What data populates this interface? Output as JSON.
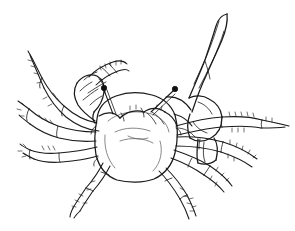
{
  "figure": {
    "view": "dorsal view",
    "medium": "black ink line drawing",
    "background_color": "#ffffff",
    "ink_color": "#1a1a1a",
    "width_px": 295,
    "height_px": 231,
    "caption": ""
  },
  "anatomy": {
    "carapace": {
      "label": "carapace",
      "outline_points": "96,118 99,104 110,96 128,92 150,93 166,99 174,112 176,134 172,156 160,172 140,180 118,180 101,170 94,150",
      "interior_contours": [
        "M108,120 C116,112 132,110 146,112 C158,114 166,121 168,131",
        "M114,131 C124,126 138,126 149,130",
        "M119,140 C130,136 143,137 152,142",
        "M104,134 C103,146 106,158 114,167",
        "M160,140 C163,150 160,162 152,170"
      ]
    },
    "eyes": [
      {
        "label": "left-eye-stalk",
        "stalk_path": "M112,113 L104,89",
        "bulb_cx": 103.5,
        "bulb_cy": 87.5,
        "bulb_r": 2.6
      },
      {
        "label": "right-eye-stalk",
        "stalk_path": "M150,111 L173,90",
        "bulb_cx": 174.5,
        "bulb_cy": 88.5,
        "bulb_r": 2.6
      }
    ],
    "orbital_rim": "M99,116 C108,112 116,113 120,118 C126,113 136,110 144,112 C150,108 158,108 164,113 C170,116 174,120 176,126",
    "major_cheliped": {
      "label": "major-cheliped-right-enlarged",
      "segments": [
        "M192,112 C196,100 200,88 206,76 C211,64 217,52 222,40 C226,30 228,22 227,14",
        "M227,14 C222,15 218,19 216,26 C213,36 209,48 205,60 C200,73 194,86 189,98",
        "M189,98 C195,96 202,96 208,99 C216,102 220,108 221,116",
        "M221,116 C221,126 217,133 210,137 C203,141 195,141 190,137",
        "M190,137 C187,130 187,122 190,115 C191,112 192,112 192,112",
        "M165,96 C176,96 185,101 190,110",
        "M199,138 C198,148 197,156 199,162",
        "M199,162 C205,164 211,163 215,159",
        "M215,159 C217,151 217,143 214,137",
        "M178,128 C186,128 193,131 198,138"
      ],
      "pincer_detail": [
        "M219,22 C216,32 212,44 207,56",
        "M223,30 C220,40 216,50 211,61",
        "M205,62 C207,68 209,74 210,80"
      ]
    },
    "minor_cheliped": {
      "label": "minor-cheliped-left-small",
      "segments": [
        "M94,120 C88,115 82,110 78,104",
        "M78,104 C74,97 73,89 76,82",
        "M76,82 C81,76 89,73 96,75",
        "M96,75 C101,78 104,84 104,91",
        "M104,91 C103,99 99,106 94,111",
        "M94,111 C92,116 92,120 94,122",
        "M90,76 C96,70 104,65 112,62",
        "M112,62 C118,62 122,65 124,70",
        "M95,83 C101,78 108,73 116,70",
        "M88,92 C94,88 100,84 106,81",
        "M83,99 C88,95 93,91 98,88",
        "M79,92 C83,88 87,85 91,83"
      ]
    },
    "legs_left": [
      {
        "label": "left-leg-1",
        "path": "M96,124 C84,121 72,114 62,104 C54,96 46,86 40,74 C36,66 33,60 31,56"
      },
      {
        "label": "left-leg-2",
        "path": "M95,134 C82,134 68,131 56,126 C44,121 34,114 26,106"
      },
      {
        "label": "left-leg-3",
        "path": "M96,146 C84,149 71,151 58,152 C46,153 36,152 28,149"
      },
      {
        "label": "left-leg-4",
        "path": "M101,164 C96,172 90,182 82,191 C76,198 70,205 66,211"
      }
    ],
    "legs_right": [
      {
        "label": "right-leg-1",
        "path": "M176,124 C190,120 206,116 222,114 C240,112 258,112 274,114 C282,115 287,116 290,117"
      },
      {
        "label": "right-leg-2",
        "path": "M177,134 C192,134 208,136 224,140 C240,144 254,150 264,157"
      },
      {
        "label": "right-leg-3",
        "path": "M175,146 C188,150 202,155 214,162 C226,169 236,177 242,185"
      },
      {
        "label": "right-leg-4",
        "path": "M168,166 C176,174 184,183 190,193 C195,202 198,210 200,216"
      }
    ],
    "setae_count": 46
  }
}
